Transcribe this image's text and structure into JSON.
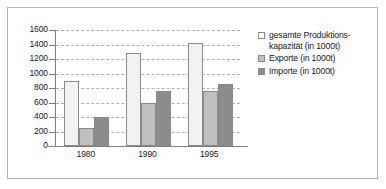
{
  "chart_data": {
    "type": "bar",
    "title": "",
    "xlabel": "",
    "ylabel": "",
    "categories": [
      "1980",
      "1990",
      "1995"
    ],
    "series": [
      {
        "name": "gesamte Produktions-\nkapazität (in 1000t)",
        "legend_label": "gesamte Produktions-\nkapazität (in 1000t)",
        "color": "#f2f2f2",
        "values": [
          890,
          1280,
          1425
        ]
      },
      {
        "name": "Exporte (in 1000t)",
        "legend_label": "Exporte (in 1000t)",
        "color": "#bfbfbf",
        "values": [
          250,
          600,
          755
        ]
      },
      {
        "name": "Importe (in 1000t)",
        "legend_label": "Importe (in 1000t)",
        "color": "#8c8c8c",
        "values": [
          400,
          755,
          855
        ]
      }
    ],
    "ylim": [
      0,
      1600
    ],
    "ytick_step": 200,
    "yticks": [
      "1600",
      "1400",
      "1200",
      "1000",
      "800",
      "600",
      "400",
      "200",
      "0"
    ],
    "grid": true,
    "grid_style": "dashed",
    "legend_position": "right",
    "axis_color": "#7d7d7d",
    "grid_color": "#b0b0b0",
    "frame_color": "#b4b4b4",
    "background": "#ffffff"
  }
}
